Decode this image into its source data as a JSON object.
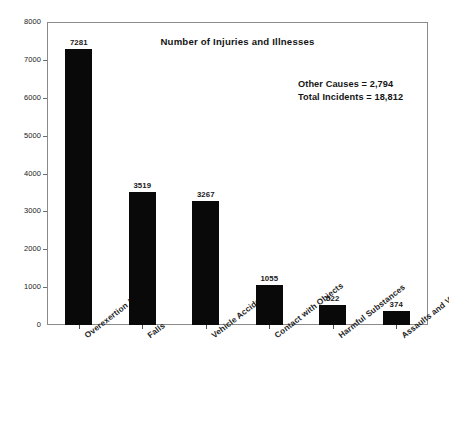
{
  "chart_data": {
    "type": "bar",
    "title": "Number of Injuries and Illnesses",
    "xlabel": "",
    "ylabel": "",
    "ylim": [
      0,
      8000
    ],
    "grid": false,
    "legend": "none",
    "categories": [
      "Overexertion / Lifting",
      "Falls",
      "Vehicle Accidents",
      "Contact with Objects",
      "Harmful Substances",
      "Assaults and Violent Acts"
    ],
    "values": [
      7281,
      3519,
      3267,
      1055,
      522,
      374
    ],
    "value_labels": [
      "7281",
      "3519",
      "3267",
      "1055",
      "522",
      "374"
    ],
    "y_ticks": [
      0,
      1000,
      2000,
      3000,
      4000,
      5000,
      6000,
      7000,
      8000
    ],
    "y_tick_labels": [
      "0",
      "1000",
      "2000",
      "3000",
      "4000",
      "5000",
      "6000",
      "7000",
      "8000"
    ],
    "annotations": [
      "Other Causes = 2,794",
      "Total Incidents = 18,812"
    ],
    "bar_color": "#090909"
  },
  "annotations": {
    "other_causes": "Other Causes = 2,794",
    "total_incidents": "Total Incidents = 18,812"
  }
}
